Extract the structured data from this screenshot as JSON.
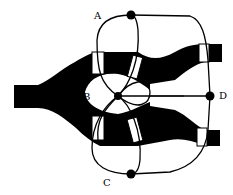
{
  "diagram": {
    "type": "schematic",
    "colors": {
      "fill": "#000000",
      "background": "#ffffff",
      "line": "#000000"
    },
    "nodes": [
      {
        "id": "A",
        "label": "A",
        "x": 131,
        "y": 15
      },
      {
        "id": "B",
        "label": "B",
        "x": 118,
        "y": 96
      },
      {
        "id": "C",
        "label": "C",
        "x": 131,
        "y": 174
      },
      {
        "id": "D",
        "label": "D",
        "x": 210,
        "y": 96
      }
    ],
    "labels": {
      "A": "A",
      "B": "B",
      "C": "C",
      "D": "D"
    }
  }
}
